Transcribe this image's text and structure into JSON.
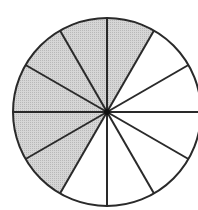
{
  "diagram": {
    "type": "fraction-circle",
    "total_sectors": 12,
    "shaded_sectors": 6,
    "shaded_start_angle_deg": 60,
    "shaded_end_angle_deg": 240,
    "fraction_shaded": "6/12",
    "colors": {
      "shade": "#cccccc",
      "line": "#2a2a2a",
      "background": "#ffffff"
    }
  }
}
